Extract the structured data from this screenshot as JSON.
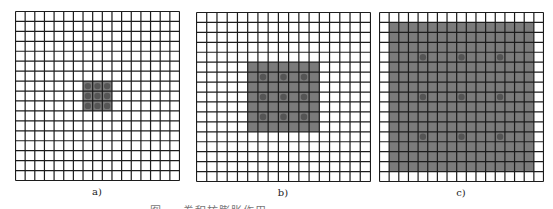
{
  "figure": {
    "grid_size": 17,
    "colors": {
      "background": "#ffffff",
      "grid_line": "#1c1c1c",
      "shade": "#7b7b7b",
      "dot": "#555555"
    },
    "panels": [
      {
        "id": "a",
        "label": "a)",
        "x": 15,
        "y": 11,
        "width": 164,
        "height": 169,
        "shade_range": [
          7,
          9
        ],
        "dot_positions": [
          7,
          8,
          9
        ]
      },
      {
        "id": "b",
        "label": "b)",
        "x": 196,
        "y": 12,
        "width": 174,
        "height": 169,
        "shade_range": [
          5,
          11
        ],
        "dot_positions": [
          6,
          8,
          10
        ]
      },
      {
        "id": "c",
        "label": "c)",
        "x": 379,
        "y": 12,
        "width": 164,
        "height": 169,
        "shade_range": [
          1,
          15
        ],
        "dot_positions": [
          4,
          8,
          12
        ]
      }
    ]
  },
  "caption": "图 — 卷积核膨胀作用 …"
}
